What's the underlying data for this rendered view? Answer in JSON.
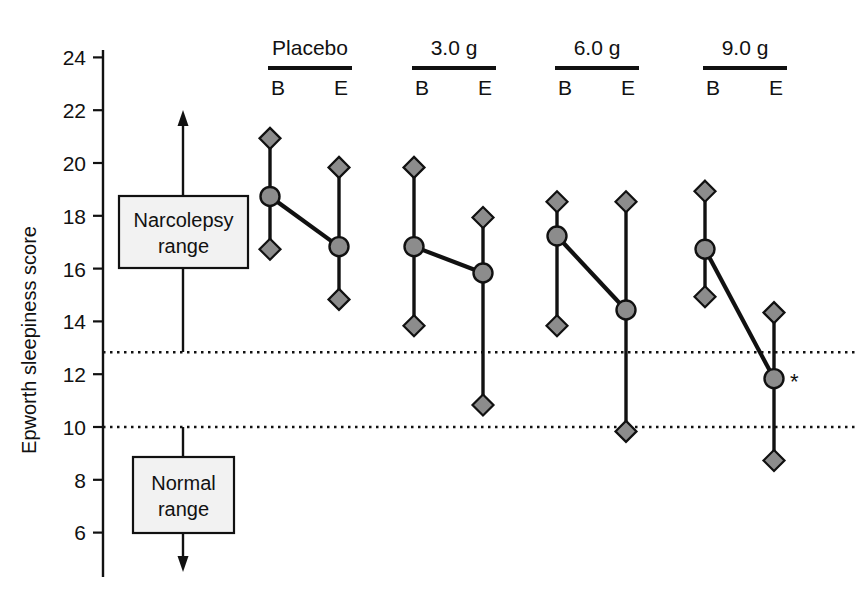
{
  "chart_data": {
    "type": "scatter",
    "title": "",
    "xlabel": "",
    "ylabel": "Epworth sleepiness score",
    "ylim": [
      5,
      25
    ],
    "yticks": [
      6,
      8,
      10,
      12,
      14,
      16,
      18,
      20,
      22,
      24
    ],
    "grid": false,
    "legend": null,
    "marker_notes": {
      "circle": "mean",
      "diamond_upper": "upper range / SD bound",
      "diamond_lower": "lower range / SD bound"
    },
    "reference_lines": [
      {
        "value": 13,
        "style": "dotted",
        "note": "narcolepsy range lower bound"
      },
      {
        "value": 10,
        "style": "dotted",
        "note": "normal range upper bound"
      }
    ],
    "groups": [
      {
        "label": "Placebo",
        "points": [
          {
            "timepoint": "B",
            "mean": 18.9,
            "upper": 21.1,
            "lower": 16.9,
            "significant": false
          },
          {
            "timepoint": "E",
            "mean": 17.0,
            "upper": 20.0,
            "lower": 15.0,
            "significant": false
          }
        ]
      },
      {
        "label": "3.0 g",
        "points": [
          {
            "timepoint": "B",
            "mean": 17.0,
            "upper": 20.0,
            "lower": 14.0,
            "significant": false
          },
          {
            "timepoint": "E",
            "mean": 16.0,
            "upper": 18.1,
            "lower": 11.0,
            "significant": false
          }
        ]
      },
      {
        "label": "6.0 g",
        "points": [
          {
            "timepoint": "B",
            "mean": 17.4,
            "upper": 18.7,
            "lower": 14.0,
            "significant": false
          },
          {
            "timepoint": "E",
            "mean": 14.6,
            "upper": 18.7,
            "lower": 10.0,
            "significant": false
          }
        ]
      },
      {
        "label": "9.0 g",
        "points": [
          {
            "timepoint": "B",
            "mean": 16.9,
            "upper": 19.1,
            "lower": 15.1,
            "significant": false
          },
          {
            "timepoint": "E",
            "mean": 12.0,
            "upper": 14.5,
            "lower": 8.9,
            "significant": true
          }
        ]
      }
    ],
    "annotations": [
      {
        "id": "narcolepsy",
        "text_line1": "Narcolepsy",
        "text_line2": "range",
        "arrow": "up"
      },
      {
        "id": "normal",
        "text_line1": "Normal",
        "text_line2": "range",
        "arrow": "down"
      },
      {
        "id": "significance",
        "text": "*"
      }
    ],
    "timepoint_labels": {
      "baseline": "B",
      "end": "E"
    }
  },
  "colors": {
    "marker_fill": "#8c8c8c",
    "marker_stroke": "#111111",
    "line": "#111111",
    "axis": "#111111",
    "box_fill": "#f2f2f2",
    "reference_line": "#111111",
    "background": "#ffffff"
  }
}
